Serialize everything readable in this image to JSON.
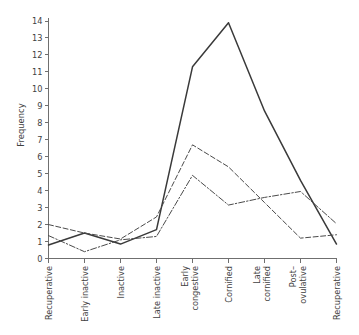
{
  "chart_data": {
    "type": "line",
    "title": "",
    "xlabel": "",
    "ylabel": "Frequency",
    "ylim": [
      0,
      14
    ],
    "ytick_step": 1,
    "grid": false,
    "legend": "none",
    "categories": [
      "Recuperative",
      "Early inactive",
      "Inactive",
      "Late inactive",
      "Early congestive",
      "Cornified",
      "Late cornified",
      "Post-ovulative",
      "Recuperative"
    ],
    "ytick_labels": [
      "0",
      "1",
      "2",
      "3",
      "4",
      "5",
      "6",
      "7",
      "8",
      "9",
      "10",
      "11",
      "12",
      "13",
      "14"
    ],
    "series": [
      {
        "name": "series-solid",
        "style": "solid",
        "color": "#3a3a3a",
        "values": [
          0.8,
          1.5,
          0.85,
          1.7,
          11.3,
          13.9,
          8.7,
          4.6,
          0.85
        ]
      },
      {
        "name": "series-dashed-upper",
        "style": "dashed",
        "color": "#4a4a4a",
        "values": [
          2.0,
          1.5,
          1.15,
          2.45,
          6.7,
          5.4,
          3.3,
          1.2,
          1.4
        ]
      },
      {
        "name": "series-dashed-lower",
        "style": "dash-dot",
        "color": "#4a4a4a",
        "values": [
          1.35,
          0.4,
          1.1,
          1.3,
          4.9,
          3.15,
          3.6,
          3.95,
          2.05
        ]
      }
    ]
  },
  "axes": {
    "y_title": "Frequency"
  }
}
